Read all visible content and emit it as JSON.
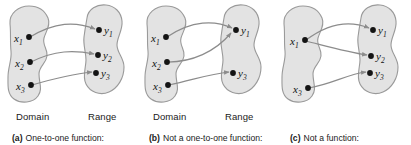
{
  "figure": {
    "name": "function-mapping-diagrams",
    "panels": [
      {
        "id": "a",
        "tag": "(a)",
        "caption": "One-to-one function:",
        "domain_label": "Domain",
        "range_label": "Range",
        "domain_points": [
          "x1",
          "x2",
          "x3"
        ],
        "range_points": [
          "y1",
          "y2",
          "y3"
        ],
        "domain_point_labels": [
          "x",
          "x",
          "x"
        ],
        "domain_point_subs": [
          "1",
          "2",
          "3"
        ],
        "range_point_labels": [
          "y",
          "y",
          "y"
        ],
        "range_point_subs": [
          "1",
          "2",
          "3"
        ],
        "mappings": [
          {
            "from": "x1",
            "to": "y1"
          },
          {
            "from": "x2",
            "to": "y2"
          },
          {
            "from": "x3",
            "to": "y3"
          }
        ]
      },
      {
        "id": "b",
        "tag": "(b)",
        "caption": "Not a one-to-one function:",
        "domain_label": "Domain",
        "range_label": "Range",
        "domain_points": [
          "x1",
          "x2",
          "x3"
        ],
        "range_points": [
          "y1",
          "y3"
        ],
        "domain_point_labels": [
          "x",
          "x",
          "x"
        ],
        "domain_point_subs": [
          "1",
          "2",
          "3"
        ],
        "range_point_labels": [
          "y",
          "y"
        ],
        "range_point_subs": [
          "1",
          "3"
        ],
        "mappings": [
          {
            "from": "x1",
            "to": "y1"
          },
          {
            "from": "x2",
            "to": "y1"
          },
          {
            "from": "x3",
            "to": "y3"
          }
        ]
      },
      {
        "id": "c",
        "tag": "(c)",
        "caption": "Not a function:",
        "domain_label": "",
        "range_label": "",
        "domain_points": [
          "x1",
          "x3"
        ],
        "range_points": [
          "y1",
          "y2",
          "y3"
        ],
        "domain_point_labels": [
          "x",
          "x"
        ],
        "domain_point_subs": [
          "1",
          "3"
        ],
        "range_point_labels": [
          "y",
          "y",
          "y"
        ],
        "range_point_subs": [
          "1",
          "2",
          "3"
        ],
        "mappings": [
          {
            "from": "x1",
            "to": "y1"
          },
          {
            "from": "x1",
            "to": "y2"
          },
          {
            "from": "x3",
            "to": "y3"
          }
        ]
      }
    ],
    "colors": {
      "blob_fill": "#e3e3e3",
      "blob_stroke": "#9a9a9a",
      "arrow": "#8c8c8c",
      "point": "#141414",
      "text": "#1a1a1a",
      "background": "#ffffff"
    }
  }
}
